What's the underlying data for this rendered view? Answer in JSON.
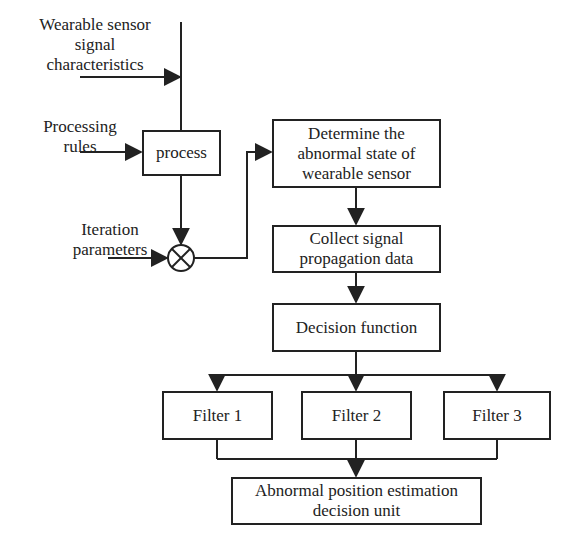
{
  "inputs": {
    "signal_characteristics": "Wearable sensor signal characteristics",
    "signal_characteristics_lines": [
      "Wearable sensor",
      "signal",
      "characteristics"
    ],
    "processing_rules_lines": [
      "Processing",
      "rules"
    ],
    "iteration_parameters_lines": [
      "Iteration",
      "parameters"
    ]
  },
  "nodes": {
    "process": "process",
    "determine": "Determine the abnormal state of wearable sensor",
    "determine_lines": [
      "Determine the",
      "abnormal state of",
      "wearable sensor"
    ],
    "collect_lines": [
      "Collect signal",
      "propagation data"
    ],
    "decision": "Decision function",
    "filters": [
      "Filter 1",
      "Filter 2",
      "Filter 3"
    ],
    "output_lines": [
      "Abnormal position estimation",
      "decision unit"
    ]
  },
  "junction": {
    "symbol": "multiply-circle"
  },
  "colors": {
    "line": "#222222",
    "background": "#ffffff"
  }
}
